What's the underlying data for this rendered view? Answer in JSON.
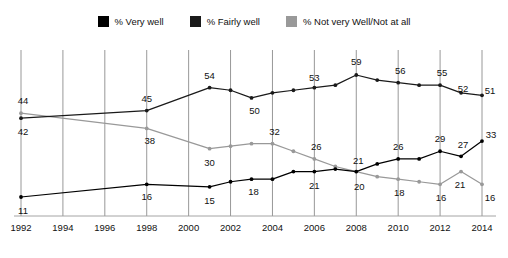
{
  "legend": {
    "items": [
      {
        "label": "% Very well",
        "color": "#000000",
        "name": "legend-swatch-very-well"
      },
      {
        "label": "% Fairly well",
        "color": "#1a1a1a",
        "name": "legend-swatch-fairly-well"
      },
      {
        "label": "% Not very Well/Not at all",
        "color": "#999999",
        "name": "legend-swatch-not-well"
      }
    ]
  },
  "chart_data": {
    "type": "line",
    "title": "",
    "xlabel": "",
    "ylabel": "",
    "xlim": [
      1992,
      2014
    ],
    "ylim": [
      0,
      62
    ],
    "grid": "vertical",
    "legend_position": "top-center",
    "x_ticks": [
      "1992",
      "1994",
      "1996",
      "1998",
      "2000",
      "2002",
      "2004",
      "2006",
      "2008",
      "2010",
      "2012",
      "2014"
    ],
    "series": [
      {
        "name": "% Fairly well",
        "color": "#1a1a1a",
        "x": [
          1992,
          1998,
          2001,
          2002,
          2003,
          2004,
          2005,
          2006,
          2007,
          2008,
          2009,
          2010,
          2011,
          2012,
          2013,
          2014
        ],
        "values": [
          42,
          45,
          54,
          53,
          50,
          52,
          53,
          54,
          55,
          59,
          57,
          56,
          55,
          55,
          52,
          51
        ],
        "labels": [
          {
            "x": 1992,
            "value": 42,
            "text": "42"
          },
          {
            "x": 1998,
            "value": 45,
            "text": "45"
          },
          {
            "x": 2001,
            "value": 54,
            "text": "54"
          },
          {
            "x": 2003,
            "value": 50,
            "text": "50"
          },
          {
            "x": 2006,
            "value": 53,
            "text": "53"
          },
          {
            "x": 2008,
            "value": 59,
            "text": "59"
          },
          {
            "x": 2010,
            "value": 56,
            "text": "56"
          },
          {
            "x": 2012,
            "value": 55,
            "text": "55"
          },
          {
            "x": 2013,
            "value": 52,
            "text": "52"
          },
          {
            "x": 2014,
            "value": 51,
            "text": "51"
          }
        ]
      },
      {
        "name": "% Not very Well/Not at all",
        "color": "#999999",
        "x": [
          1992,
          1998,
          2001,
          2002,
          2003,
          2004,
          2005,
          2006,
          2007,
          2008,
          2009,
          2010,
          2011,
          2012,
          2013,
          2014
        ],
        "values": [
          44,
          38,
          30,
          31,
          32,
          32,
          29,
          26,
          23,
          21,
          19,
          18,
          17,
          16,
          21,
          16
        ],
        "labels": [
          {
            "x": 1992,
            "value": 44,
            "text": "44"
          },
          {
            "x": 1998,
            "value": 38,
            "text": "38"
          },
          {
            "x": 2001,
            "value": 30,
            "text": "30"
          },
          {
            "x": 2004,
            "value": 32,
            "text": "32"
          },
          {
            "x": 2006,
            "value": 26,
            "text": "26"
          },
          {
            "x": 2008,
            "value": 20,
            "text": "20"
          },
          {
            "x": 2010,
            "value": 18,
            "text": "18"
          },
          {
            "x": 2012,
            "value": 16,
            "text": "16"
          },
          {
            "x": 2013,
            "value": 21,
            "text": "21"
          },
          {
            "x": 2014,
            "value": 16,
            "text": "16"
          }
        ]
      },
      {
        "name": "% Very well",
        "color": "#000000",
        "x": [
          1992,
          1998,
          2001,
          2002,
          2003,
          2004,
          2005,
          2006,
          2007,
          2008,
          2009,
          2010,
          2011,
          2012,
          2013,
          2014
        ],
        "values": [
          11,
          16,
          15,
          17,
          18,
          18,
          21,
          21,
          22,
          21,
          24,
          26,
          26,
          29,
          27,
          33
        ],
        "labels": [
          {
            "x": 1992,
            "value": 11,
            "text": "11"
          },
          {
            "x": 1998,
            "value": 16,
            "text": "16"
          },
          {
            "x": 2001,
            "value": 15,
            "text": "15"
          },
          {
            "x": 2003,
            "value": 18,
            "text": "18"
          },
          {
            "x": 2006,
            "value": 21,
            "text": "21"
          },
          {
            "x": 2008,
            "value": 21,
            "text": "21"
          },
          {
            "x": 2010,
            "value": 26,
            "text": "26"
          },
          {
            "x": 2012,
            "value": 29,
            "text": "29"
          },
          {
            "x": 2013,
            "value": 27,
            "text": "27"
          },
          {
            "x": 2014,
            "value": 33,
            "text": "33"
          }
        ]
      }
    ]
  }
}
